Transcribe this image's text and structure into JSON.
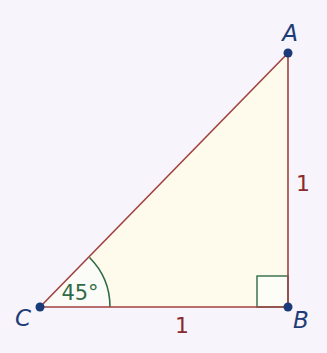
{
  "diagram": {
    "type": "right-triangle",
    "colors": {
      "background": "#f7f4fb",
      "fill": "#fffbec",
      "edge": "#a0423f",
      "point": "#1a3a78",
      "angle_mark": "#2f6b46",
      "label": "#1f3c78",
      "side_label": "#8a2a2e"
    },
    "vertices": {
      "A": {
        "label": "A",
        "x": 288,
        "y": 53
      },
      "B": {
        "label": "B",
        "x": 288,
        "y": 307
      },
      "C": {
        "label": "C",
        "x": 40,
        "y": 307
      }
    },
    "sides": {
      "CB": {
        "label": "1"
      },
      "AB": {
        "label": "1"
      }
    },
    "angles": {
      "C": {
        "label": "45°"
      },
      "B": {
        "marker": "right-angle"
      }
    }
  }
}
